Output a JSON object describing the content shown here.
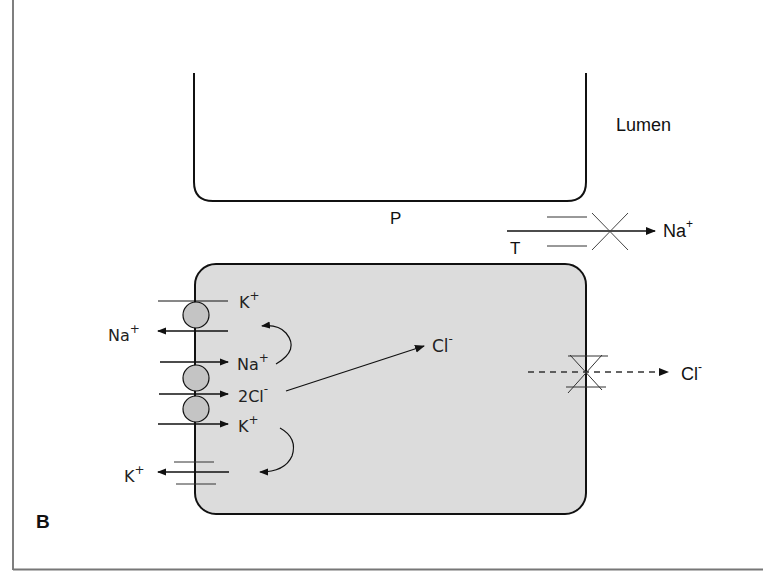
{
  "figure": {
    "panel_label": "B",
    "colors": {
      "line": "#111111",
      "cell_fill": "#dcdcdc",
      "transporter_fill": "#c4c4c4",
      "frame": "#777777",
      "background": "#ffffff"
    }
  },
  "lumen": {
    "label": "Lumen",
    "pathway_label": "P"
  },
  "tight_junction": {
    "label": "T",
    "ion": "Na",
    "ion_charge": "+"
  },
  "cell": {
    "pump": {
      "k_in": {
        "ion": "K",
        "charge": "+"
      },
      "na_out": {
        "ion": "Na",
        "charge": "+"
      }
    },
    "cotransporter": {
      "na_in": {
        "ion": "Na",
        "charge": "+"
      },
      "cl_in": {
        "ion": "2Cl",
        "charge": "-"
      },
      "k_in": {
        "ion": "K",
        "charge": "+"
      }
    },
    "k_channel": {
      "ion": "K",
      "charge": "+"
    },
    "cl_internal": {
      "ion": "Cl",
      "charge": "-"
    },
    "cl_channel_out": {
      "ion": "Cl",
      "charge": "-"
    }
  }
}
